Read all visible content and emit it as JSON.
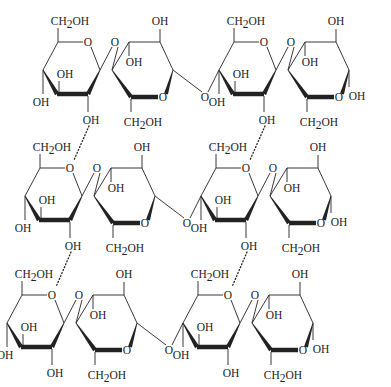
{
  "diagram": {
    "type": "chemical-structure",
    "colors": {
      "ink": "#222222",
      "background": "#ffffff"
    },
    "labels": {
      "ch2oh": "CH2OH",
      "ch2oh_parts": {
        "ch": "CH",
        "sub": "2",
        "oh": "OH"
      },
      "oh": "OH",
      "o": "O"
    },
    "rows": [
      {
        "name": "chain-1",
        "dx": 0,
        "dy": 0
      },
      {
        "name": "chain-2",
        "dx": -18,
        "dy": 126
      },
      {
        "name": "chain-3",
        "dx": -36,
        "dy": 253
      }
    ],
    "rings_per_chain": 4,
    "hydrogen_bonds": [
      {
        "from_chain": 1,
        "from_ring": 1,
        "to_chain": 2,
        "to_ring": 1
      },
      {
        "from_chain": 1,
        "from_ring": 3,
        "to_chain": 2,
        "to_ring": 3
      },
      {
        "from_chain": 2,
        "from_ring": 1,
        "to_chain": 3,
        "to_ring": 1
      },
      {
        "from_chain": 2,
        "from_ring": 3,
        "to_chain": 3,
        "to_ring": 3
      }
    ]
  }
}
